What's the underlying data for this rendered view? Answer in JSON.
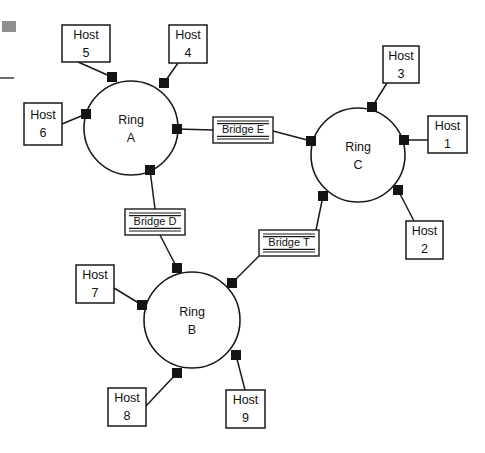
{
  "diagram": {
    "type": "network-topology",
    "canvas": {
      "width": 485,
      "height": 453,
      "background": "#ffffff"
    },
    "stroke_color": "#1a1a1a",
    "node_color": "#141414",
    "rings": [
      {
        "id": "ring-a",
        "label_line1": "Ring",
        "label_line2": "A",
        "cx": 131,
        "cy": 128,
        "r": 47,
        "nodes": [
          {
            "id": "a-n1",
            "x": 112,
            "y": 77
          },
          {
            "id": "a-n2",
            "x": 164,
            "y": 83
          },
          {
            "id": "a-n3",
            "x": 86,
            "y": 114
          },
          {
            "id": "a-n4",
            "x": 177,
            "y": 129
          },
          {
            "id": "a-n5",
            "x": 150,
            "y": 170
          }
        ]
      },
      {
        "id": "ring-c",
        "label_line1": "Ring",
        "label_line2": "C",
        "cx": 358,
        "cy": 155,
        "r": 47,
        "nodes": [
          {
            "id": "c-n1",
            "x": 372,
            "y": 107
          },
          {
            "id": "c-n2",
            "x": 311,
            "y": 141
          },
          {
            "id": "c-n3",
            "x": 404,
            "y": 140
          },
          {
            "id": "c-n4",
            "x": 323,
            "y": 196
          },
          {
            "id": "c-n5",
            "x": 398,
            "y": 190
          }
        ]
      },
      {
        "id": "ring-b",
        "label_line1": "Ring",
        "label_line2": "B",
        "cx": 192,
        "cy": 320,
        "r": 48,
        "nodes": [
          {
            "id": "b-n1",
            "x": 177,
            "y": 268
          },
          {
            "id": "b-n2",
            "x": 232,
            "y": 283
          },
          {
            "id": "b-n3",
            "x": 142,
            "y": 305
          },
          {
            "id": "b-n4",
            "x": 236,
            "y": 355
          },
          {
            "id": "b-n5",
            "x": 177,
            "y": 373
          }
        ]
      }
    ],
    "hosts": [
      {
        "id": "host-1",
        "line1": "Host",
        "line2": "1",
        "x": 428,
        "y": 116,
        "w": 39,
        "h": 37,
        "anchor_x": 428,
        "anchor_y": 140,
        "node": "c-n3"
      },
      {
        "id": "host-2",
        "line1": "Host",
        "line2": "2",
        "x": 406,
        "y": 221,
        "w": 37,
        "h": 38,
        "anchor_x": 414,
        "anchor_y": 221,
        "node": "c-n5"
      },
      {
        "id": "host-3",
        "line1": "Host",
        "line2": "3",
        "x": 383,
        "y": 46,
        "w": 36,
        "h": 37,
        "anchor_x": 387,
        "anchor_y": 83,
        "node": "c-n1"
      },
      {
        "id": "host-4",
        "line1": "Host",
        "line2": "4",
        "x": 169,
        "y": 25,
        "w": 38,
        "h": 38,
        "anchor_x": 178,
        "anchor_y": 63,
        "node": "a-n2"
      },
      {
        "id": "host-5",
        "line1": "Host",
        "line2": "5",
        "x": 62,
        "y": 25,
        "w": 48,
        "h": 37,
        "anchor_x": 78,
        "anchor_y": 62,
        "node": "a-n1"
      },
      {
        "id": "host-6",
        "line1": "Host",
        "line2": "6",
        "x": 24,
        "y": 103,
        "w": 38,
        "h": 42,
        "anchor_x": 62,
        "anchor_y": 124,
        "node": "a-n3"
      },
      {
        "id": "host-7",
        "line1": "Host",
        "line2": "7",
        "x": 76,
        "y": 265,
        "w": 38,
        "h": 38,
        "anchor_x": 114,
        "anchor_y": 288,
        "node": "b-n3"
      },
      {
        "id": "host-8",
        "line1": "Host",
        "line2": "8",
        "x": 108,
        "y": 388,
        "w": 38,
        "h": 38,
        "anchor_x": 146,
        "anchor_y": 406,
        "node": "b-n5"
      },
      {
        "id": "host-9",
        "line1": "Host",
        "line2": "9",
        "x": 226,
        "y": 390,
        "w": 39,
        "h": 38,
        "anchor_x": 245,
        "anchor_y": 390,
        "node": "b-n4"
      }
    ],
    "bridges": [
      {
        "id": "bridge-e",
        "label": "Bridge E",
        "x": 213,
        "y": 117,
        "w": 60,
        "h": 26,
        "connections": [
          {
            "from_node": "a-n4",
            "anchor_x": 213,
            "anchor_y": 130
          },
          {
            "from_node": "c-n2",
            "anchor_x": 273,
            "anchor_y": 131
          }
        ]
      },
      {
        "id": "bridge-d",
        "label": "Bridge D",
        "x": 125,
        "y": 209,
        "w": 60,
        "h": 26,
        "connections": [
          {
            "from_node": "a-n5",
            "anchor_x": 155,
            "anchor_y": 209
          },
          {
            "from_node": "b-n1",
            "anchor_x": 160,
            "anchor_y": 235
          }
        ]
      },
      {
        "id": "bridge-t",
        "label": "Bridge T",
        "x": 259,
        "y": 230,
        "w": 60,
        "h": 26,
        "connections": [
          {
            "from_node": "c-n4",
            "anchor_x": 316,
            "anchor_y": 230
          },
          {
            "from_node": "b-n2",
            "anchor_x": 259,
            "anchor_y": 256
          }
        ]
      }
    ],
    "artifacts": [
      {
        "id": "scan-mark-square",
        "x": 2,
        "y": 21,
        "w": 14,
        "h": 11,
        "color": "#8f8f8f"
      },
      {
        "id": "scan-mark-dash",
        "x": 0,
        "y": 77,
        "w": 14,
        "h": 2,
        "color": "#6e6e6e"
      }
    ]
  }
}
